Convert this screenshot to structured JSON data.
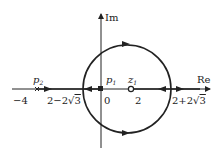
{
  "diagram": {
    "type": "root-locus",
    "axes": {
      "real_label": "Re",
      "imag_label": "Im"
    },
    "poles": [
      {
        "name": "p1",
        "label": "p",
        "sub": "1",
        "value": 0,
        "tick": "0"
      },
      {
        "name": "p2",
        "label": "p",
        "sub": "2",
        "value": -4,
        "tick": "−4"
      }
    ],
    "zeros": [
      {
        "name": "z1",
        "label": "z",
        "sub": "1",
        "value": 2,
        "tick": "2"
      }
    ],
    "breakpoints": [
      {
        "label": "2−2√3",
        "prefix": "2−2",
        "radicand": "3"
      },
      {
        "label": "2+2√3",
        "prefix": "2+2",
        "radicand": "3"
      }
    ],
    "circle": {
      "center": 2,
      "radius": "2√3"
    },
    "stroke_color": "#222222"
  }
}
